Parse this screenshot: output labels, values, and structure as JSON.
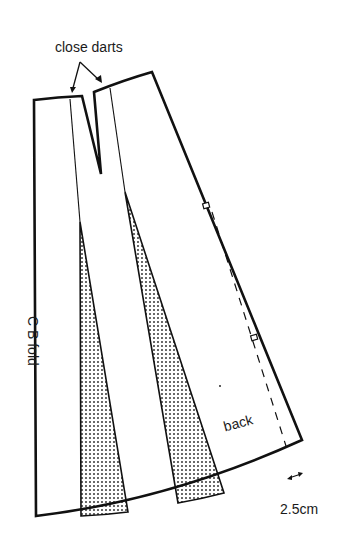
{
  "diagram": {
    "type": "sewing-pattern",
    "labels": {
      "close_darts": "close darts",
      "cb_fold": "C B fold",
      "back": "back",
      "measure": "2.5cm"
    },
    "annotations": [
      {
        "id": "close-darts-arrows",
        "text": "close darts",
        "points_to": [
          "left dart edge",
          "right dart edge"
        ]
      },
      {
        "id": "seam-allowance",
        "text": "2.5cm",
        "kind": "double-headed arrow"
      }
    ],
    "parts": [
      {
        "id": "cb-fold-edge",
        "kind": "straight edge",
        "label": "C B fold"
      },
      {
        "id": "waist-dart",
        "kind": "dart",
        "note": "to be closed"
      },
      {
        "id": "spread-wedge-1",
        "kind": "shaded insertion"
      },
      {
        "id": "spread-wedge-2",
        "kind": "shaded insertion"
      },
      {
        "id": "side-seam",
        "kind": "straight edge with 2 notches"
      },
      {
        "id": "dashed-guide",
        "kind": "dashed line, 2.5cm from side seam"
      },
      {
        "id": "hem",
        "kind": "curved edge"
      }
    ],
    "colors": {
      "line": "#111111",
      "dot": "#2a2a2a",
      "paper": "#ffffff"
    }
  }
}
